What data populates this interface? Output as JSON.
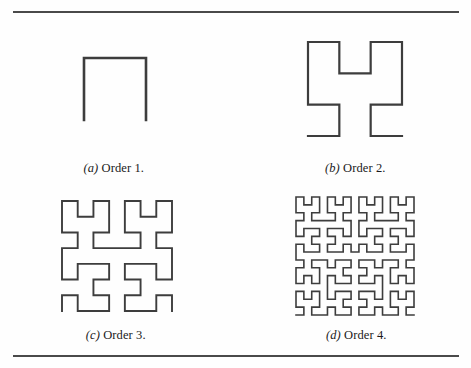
{
  "figure": {
    "kind": "hilbert-curve-orders",
    "rule_color": "#4a4a4a",
    "stroke_color": "#3d3d3d",
    "background": "#fefefe",
    "panels": [
      {
        "id": "a",
        "label": "(a)",
        "label_letter": "a",
        "caption": "Order 1.",
        "order": 1,
        "segments": 3,
        "grid": "2x2"
      },
      {
        "id": "b",
        "label": "(b)",
        "label_letter": "b",
        "caption": "Order 2.",
        "order": 2,
        "segments": 15,
        "grid": "4x4"
      },
      {
        "id": "c",
        "label": "(c)",
        "label_letter": "c",
        "caption": "Order 3.",
        "order": 3,
        "segments": 63,
        "grid": "8x8"
      },
      {
        "id": "d",
        "label": "(d)",
        "label_letter": "d",
        "caption": "Order 4.",
        "order": 4,
        "segments": 255,
        "grid": "16x16"
      }
    ]
  },
  "chart_data": {
    "type": "line",
    "title": "",
    "subtitle": "",
    "xlabel": "",
    "ylabel": "",
    "grid": false,
    "legend": "none",
    "series": [
      {
        "name": "Order 1",
        "order": 1,
        "points": 4,
        "cells": "2x2"
      },
      {
        "name": "Order 2",
        "order": 2,
        "points": 16,
        "cells": "4x4"
      },
      {
        "name": "Order 3",
        "order": 3,
        "points": 64,
        "cells": "8x8"
      },
      {
        "name": "Order 4",
        "order": 4,
        "points": 256,
        "cells": "16x16"
      }
    ]
  }
}
